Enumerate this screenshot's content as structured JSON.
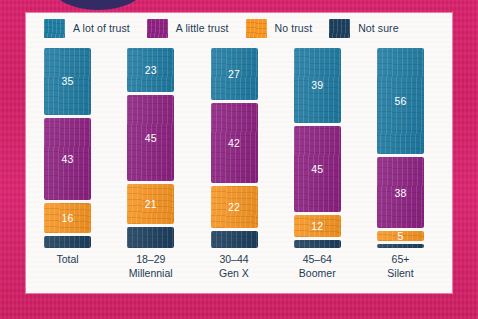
{
  "background": {
    "color": "#D8206A",
    "blob_color": "#262C63",
    "card_color": "#FBFAF8"
  },
  "legend": {
    "items": [
      {
        "label": "A lot of trust",
        "color": "#1F7CA3"
      },
      {
        "label": "A little trust",
        "color": "#8E2182"
      },
      {
        "label": "No trust",
        "color": "#F89521"
      },
      {
        "label": "Not sure",
        "color": "#1C3F5E"
      }
    ]
  },
  "axis": {
    "labels": [
      {
        "line1": "Total",
        "line2": ""
      },
      {
        "line1": "18–29",
        "line2": "Millennial"
      },
      {
        "line1": "30–44",
        "line2": "Gen X"
      },
      {
        "line1": "45–64",
        "line2": "Boomer"
      },
      {
        "line1": "65+",
        "line2": "Silent"
      }
    ]
  },
  "chart_data": {
    "type": "bar",
    "title": "",
    "subtitle": "",
    "xlabel": "",
    "ylabel": "",
    "stacked": true,
    "normalized_percent": true,
    "grid": false,
    "legend_position": "top",
    "ylim": [
      0,
      100
    ],
    "categories": [
      "Total",
      "18–29 Millennial",
      "30–44 Gen X",
      "45–64 Boomer",
      "65+ Silent"
    ],
    "series": [
      {
        "name": "A lot of trust",
        "color": "#1F7CA3",
        "values": [
          35,
          23,
          27,
          39,
          56
        ]
      },
      {
        "name": "A little trust",
        "color": "#8E2182",
        "values": [
          43,
          45,
          42,
          45,
          38
        ]
      },
      {
        "name": "No trust",
        "color": "#F89521",
        "values": [
          16,
          21,
          22,
          12,
          5
        ]
      },
      {
        "name": "Not sure",
        "color": "#1C3F5E",
        "values": [
          6,
          11,
          9,
          4,
          1
        ]
      }
    ],
    "value_labels_shown": {
      "A lot of trust": [
        35,
        23,
        27,
        39,
        56
      ],
      "A little trust": [
        43,
        45,
        42,
        45,
        38
      ],
      "No trust": [
        16,
        21,
        22,
        12,
        5
      ],
      "Not sure": [
        null,
        null,
        null,
        null,
        null
      ]
    },
    "columns": [
      {
        "category": "Total",
        "segments": [
          {
            "series": "A lot of trust",
            "value": 35,
            "label": "35",
            "label_visible": true,
            "color": "#1F7CA3"
          },
          {
            "series": "A little trust",
            "value": 43,
            "label": "43",
            "label_visible": true,
            "color": "#8E2182"
          },
          {
            "series": "No trust",
            "value": 16,
            "label": "16",
            "label_visible": true,
            "color": "#F89521"
          },
          {
            "series": "Not sure",
            "value": 6,
            "label": "",
            "label_visible": false,
            "color": "#1C3F5E"
          }
        ]
      },
      {
        "category": "18–29 Millennial",
        "segments": [
          {
            "series": "A lot of trust",
            "value": 23,
            "label": "23",
            "label_visible": true,
            "color": "#1F7CA3"
          },
          {
            "series": "A little trust",
            "value": 45,
            "label": "45",
            "label_visible": true,
            "color": "#8E2182"
          },
          {
            "series": "No trust",
            "value": 21,
            "label": "21",
            "label_visible": true,
            "color": "#F89521"
          },
          {
            "series": "Not sure",
            "value": 11,
            "label": "",
            "label_visible": false,
            "color": "#1C3F5E"
          }
        ]
      },
      {
        "category": "30–44 Gen X",
        "segments": [
          {
            "series": "A lot of trust",
            "value": 27,
            "label": "27",
            "label_visible": true,
            "color": "#1F7CA3"
          },
          {
            "series": "A little trust",
            "value": 42,
            "label": "42",
            "label_visible": true,
            "color": "#8E2182"
          },
          {
            "series": "No trust",
            "value": 22,
            "label": "22",
            "label_visible": true,
            "color": "#F89521"
          },
          {
            "series": "Not sure",
            "value": 9,
            "label": "",
            "label_visible": false,
            "color": "#1C3F5E"
          }
        ]
      },
      {
        "category": "45–64 Boomer",
        "segments": [
          {
            "series": "A lot of trust",
            "value": 39,
            "label": "39",
            "label_visible": true,
            "color": "#1F7CA3"
          },
          {
            "series": "A little trust",
            "value": 45,
            "label": "45",
            "label_visible": true,
            "color": "#8E2182"
          },
          {
            "series": "No trust",
            "value": 12,
            "label": "12",
            "label_visible": true,
            "color": "#F89521"
          },
          {
            "series": "Not sure",
            "value": 4,
            "label": "",
            "label_visible": false,
            "color": "#1C3F5E"
          }
        ]
      },
      {
        "category": "65+ Silent",
        "segments": [
          {
            "series": "A lot of trust",
            "value": 56,
            "label": "56",
            "label_visible": true,
            "color": "#1F7CA3"
          },
          {
            "series": "A little trust",
            "value": 38,
            "label": "38",
            "label_visible": true,
            "color": "#8E2182"
          },
          {
            "series": "No trust",
            "value": 5,
            "label": "5",
            "label_visible": true,
            "color": "#F89521"
          },
          {
            "series": "Not sure",
            "value": 1,
            "label": "",
            "label_visible": false,
            "color": "#1C3F5E"
          }
        ]
      }
    ]
  }
}
